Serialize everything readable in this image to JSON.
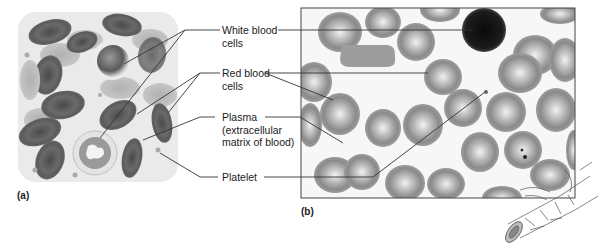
{
  "figure": {
    "panels": [
      {
        "id": "a",
        "label": "(a)",
        "description": "illustration"
      },
      {
        "id": "b",
        "label": "(b)",
        "description": "micrograph"
      }
    ],
    "labels": [
      {
        "id": "white_blood_cells",
        "line1": "White blood",
        "line2": "cells"
      },
      {
        "id": "red_blood_cells",
        "line1": "Red blood",
        "line2": "cells"
      },
      {
        "id": "plasma",
        "line1": "Plasma",
        "line2": "(extracellular",
        "line3": "matrix of blood)"
      },
      {
        "id": "platelet",
        "line1": "Platelet"
      }
    ],
    "colors": {
      "text": "#222222",
      "leader_line": "#333333",
      "rbc_dark": "#5a5a5a",
      "rbc_light": "#b9b9b9",
      "wbc_dark": "#1a1a1a",
      "background": "#ffffff"
    }
  }
}
